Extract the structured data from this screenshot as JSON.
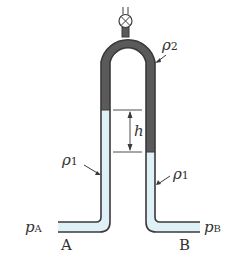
{
  "diagram": {
    "type": "inverted U-tube manometer",
    "labels": {
      "rho2": "ρ",
      "rho2_sub": "2",
      "rho1_left": "ρ",
      "rho1_left_sub": "1",
      "rho1_right": "ρ",
      "rho1_right_sub": "1",
      "h": "h",
      "pA": "p",
      "pA_sub": "A",
      "pB": "p",
      "pB_sub": "B",
      "A": "A",
      "B": "B"
    },
    "colors": {
      "tube_wall": "#3a3a3a",
      "fluid_light": "#dff0f7",
      "fluid_dark": "#5a5a5a",
      "background": "#ffffff"
    }
  }
}
